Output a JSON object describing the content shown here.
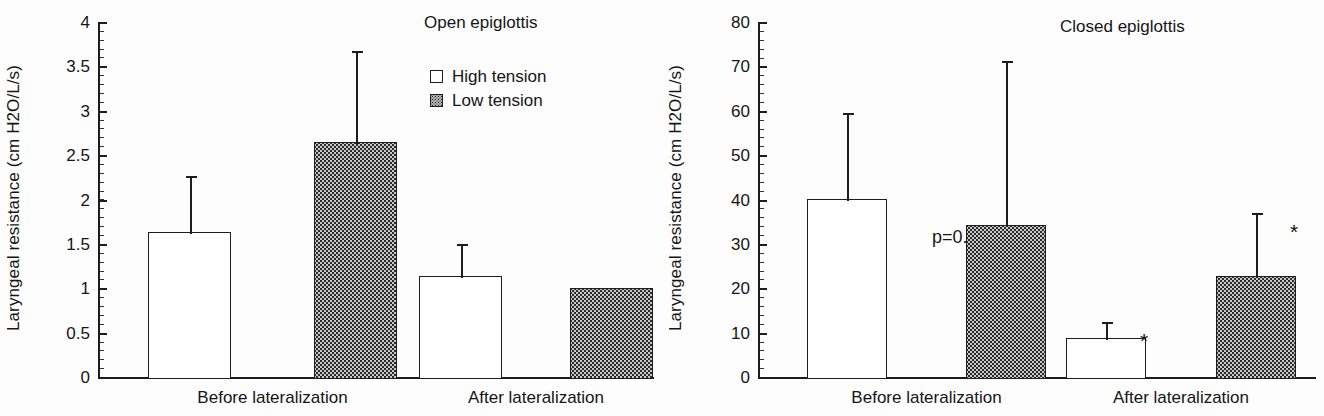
{
  "figure": {
    "ylabel": "Laryngeal  resistance (cm H2O/L/s)",
    "legend": {
      "high_label": "High  tension",
      "low_label": "Low  tension",
      "high_icon": "open-square-icon",
      "low_icon": "stippled-square-icon"
    },
    "categories": [
      "Before lateralization",
      "After lateralization"
    ]
  },
  "chart_data": [
    {
      "type": "bar",
      "title": "Open epiglottis",
      "panel": "left",
      "xlabel": "",
      "ylabel": "Laryngeal  resistance (cm H2O/L/s)",
      "ylim": [
        0,
        4
      ],
      "ytick_step": 0.5,
      "yticks": [
        0,
        0.5,
        1,
        1.5,
        2,
        2.5,
        3,
        3.5,
        4
      ],
      "ytick_labels": [
        "0",
        "0.5",
        "1",
        "1.5",
        "2",
        "2.5",
        "3",
        "3.5",
        "4"
      ],
      "minor_tick_step": 0.1,
      "grid": false,
      "legend_position": "top-right",
      "categories": [
        "Before lateralization",
        "After lateralization"
      ],
      "series": [
        {
          "name": "High  tension",
          "fill": "white",
          "values": [
            1.63,
            1.14
          ],
          "error_upper": [
            2.27,
            1.5
          ],
          "significance": [
            "",
            ""
          ]
        },
        {
          "name": "Low  tension",
          "fill": "stipple",
          "values": [
            2.65,
            1.0
          ],
          "error_upper": [
            3.67,
            null
          ],
          "significance": [
            "",
            ""
          ]
        }
      ],
      "annotations": []
    },
    {
      "type": "bar",
      "title": "Closed epiglottis",
      "panel": "right",
      "xlabel": "",
      "ylabel": "Laryngeal  resistance (cm H2O/L/s)",
      "ylim": [
        0,
        80
      ],
      "ytick_step": 10,
      "yticks": [
        0,
        10,
        20,
        30,
        40,
        50,
        60,
        70,
        80
      ],
      "ytick_labels": [
        "0",
        "10",
        "20",
        "30",
        "40",
        "50",
        "60",
        "70",
        "80"
      ],
      "minor_tick_step": 2,
      "grid": false,
      "legend_position": "none",
      "categories": [
        "Before lateralization",
        "After lateralization"
      ],
      "series": [
        {
          "name": "High  tension",
          "fill": "white",
          "values": [
            40.2,
            8.7
          ],
          "error_upper": [
            59.5,
            12.5
          ],
          "significance": [
            "",
            "*"
          ]
        },
        {
          "name": "Low  tension",
          "fill": "stipple",
          "values": [
            34.3,
            22.8
          ],
          "error_upper": [
            71.2,
            37.0
          ],
          "significance": [
            "",
            "*"
          ]
        }
      ],
      "annotations": [
        {
          "text": "p=0.016",
          "name": "p-value-annotation"
        }
      ]
    }
  ],
  "colors": {
    "ink": "#1d1d1d",
    "stipple_fill": "#c9c9c9",
    "background": "#ffffff"
  }
}
